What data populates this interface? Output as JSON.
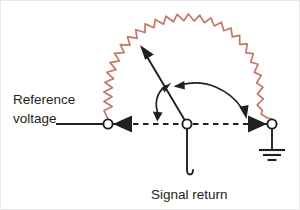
{
  "figure": {
    "background_color": "#ffffff",
    "border_color": "#e8e8e8"
  },
  "colors": {
    "resistor": "#c4776b",
    "wire": "#231f20",
    "text": "#231f20",
    "node_fill": "#ffffff"
  },
  "labels": {
    "reference_voltage_line1": "Reference",
    "reference_voltage_line2": "voltage",
    "signal_return": "Signal return"
  },
  "nodes": [
    {
      "name": "reference-voltage-node",
      "x": 107,
      "y": 123,
      "r": 5
    },
    {
      "name": "signal-return-node",
      "x": 186,
      "y": 123,
      "r": 5
    },
    {
      "name": "ground-node",
      "x": 271,
      "y": 123,
      "r": 5
    }
  ],
  "components": {
    "resistor": {
      "type": "zigzag-arc",
      "semantic": "distributed-ground-impedance",
      "from_node": "reference-voltage-node",
      "to_node": "ground-node",
      "color": "#c4776b"
    },
    "ground_symbol": {
      "type": "earth-ground",
      "bars": 3,
      "x": 271,
      "y": 152
    },
    "baseline": {
      "type": "dashed",
      "y": 123,
      "x_start": 107,
      "x_end": 271
    },
    "potential_vector": {
      "type": "solid-arrow",
      "from_x": 186,
      "from_y": 123,
      "to_x": 139,
      "to_y": 44
    },
    "angle_arc_left": {
      "type": "double-headed-arc",
      "label": ""
    },
    "angle_arc_right": {
      "type": "double-headed-arc",
      "label": ""
    }
  },
  "icons": {
    "ground": "earth-ground-icon",
    "resistor": "zigzag-resistor-icon",
    "node": "terminal-node-icon",
    "arrowhead": "arrowhead-icon"
  }
}
